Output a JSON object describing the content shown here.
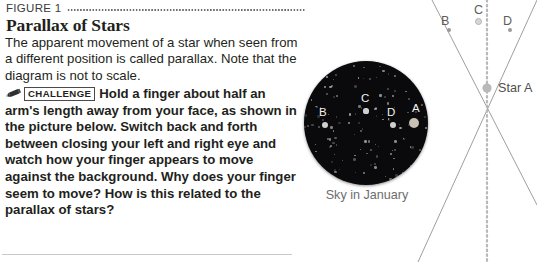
{
  "figure": {
    "label": "FIGURE 1",
    "heading": "Parallax of Stars"
  },
  "body": {
    "intro": "The apparent movement of a star when seen from a different position is called parallax. Note that the diagram is not to scale.",
    "challenge_badge": "CHALLENGE",
    "challenge_text": "Hold a finger about half an arm's length away from your face, as shown in the picture below. Switch back and forth between closing your left and right eye and watch how your finger appears to move against the background. Why does your finger seem to move? How is this related to the parallax of stars?"
  },
  "sky": {
    "caption": "Sky in January",
    "stars": [
      {
        "label": "B",
        "lx": 15,
        "ly": 45,
        "dx": 21,
        "dy": 64,
        "r": 3.0
      },
      {
        "label": "C",
        "lx": 57,
        "ly": 31,
        "dx": 62,
        "dy": 50,
        "r": 2.6
      },
      {
        "label": "D",
        "lx": 83,
        "ly": 45,
        "dx": 89,
        "dy": 64,
        "r": 3.0
      },
      {
        "label": "A",
        "lx": 108,
        "ly": 41,
        "dx": 110,
        "dy": 62,
        "r": 5.2
      }
    ],
    "background_color": "#0a0a0c",
    "star_color": "#cfcfcf"
  },
  "diagram": {
    "labels": [
      {
        "text": "B",
        "x": 441,
        "y": 14
      },
      {
        "text": "C",
        "x": 474,
        "y": 3
      },
      {
        "text": "D",
        "x": 503,
        "y": 14
      }
    ],
    "stars": [
      {
        "x": 449,
        "y": 30,
        "r": 2.2
      },
      {
        "x": 478,
        "y": 20,
        "r": 2.6
      },
      {
        "x": 510,
        "y": 30,
        "r": 2.2
      }
    ],
    "star_a_label": "Star A",
    "star_a_label_x": 498,
    "star_a_label_y": 81,
    "crossing_x": 487,
    "crossing_y": 88,
    "line_color": "#9e9e9e",
    "dotted_color": "#b8b8b8"
  }
}
